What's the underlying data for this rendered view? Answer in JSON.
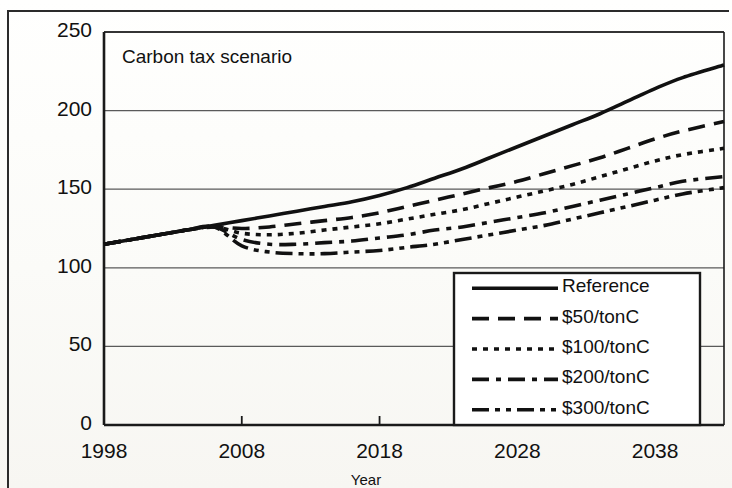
{
  "figure": {
    "title": "Carbon tax scenario",
    "x_axis_title": "Year"
  },
  "chart_data": {
    "type": "line",
    "title": "Carbon tax scenario",
    "xlabel": "Year",
    "ylabel": "",
    "xlim": [
      1998,
      2043
    ],
    "ylim": [
      0,
      250
    ],
    "xticks": [
      1998,
      2008,
      2018,
      2028,
      2038
    ],
    "yticks": [
      0,
      50,
      100,
      150,
      200,
      250
    ],
    "grid": "horizontal",
    "legend_position": "bottom-right",
    "x": [
      1998,
      2000,
      2002,
      2004,
      2006,
      2008,
      2010,
      2012,
      2014,
      2016,
      2018,
      2020,
      2022,
      2024,
      2026,
      2028,
      2030,
      2032,
      2034,
      2036,
      2038,
      2040,
      2043
    ],
    "series": [
      {
        "name": "Reference",
        "style": "solid",
        "values": [
          115,
          118,
          121,
          124,
          127,
          130,
          133,
          136,
          139,
          142,
          146,
          151,
          157,
          163,
          170,
          177,
          184,
          191,
          198,
          206,
          214,
          221,
          229
        ]
      },
      {
        "name": "$50/tonC",
        "style": "dashed",
        "values": [
          115,
          118,
          121,
          124,
          126,
          125,
          126,
          128,
          130,
          132,
          135,
          139,
          143,
          147,
          151,
          155,
          160,
          165,
          170,
          176,
          182,
          187,
          193
        ]
      },
      {
        "name": "$100/tonC",
        "style": "dotted",
        "values": [
          115,
          118,
          121,
          124,
          126,
          122,
          121,
          122,
          124,
          126,
          128,
          131,
          134,
          137,
          141,
          145,
          149,
          153,
          158,
          163,
          168,
          172,
          176
        ]
      },
      {
        "name": "$200/tonC",
        "style": "dash-dot",
        "values": [
          115,
          118,
          121,
          124,
          126,
          118,
          115,
          115,
          116,
          117,
          119,
          121,
          124,
          126,
          129,
          132,
          135,
          139,
          143,
          147,
          151,
          155,
          158
        ]
      },
      {
        "name": "$300/tonC",
        "style": "dash-dot-dot",
        "values": [
          115,
          118,
          121,
          124,
          126,
          114,
          110,
          109,
          109,
          110,
          111,
          113,
          115,
          118,
          121,
          124,
          127,
          131,
          135,
          139,
          143,
          147,
          151
        ]
      }
    ]
  },
  "legend": {
    "items": [
      {
        "label": "Reference",
        "style": "solid"
      },
      {
        "label": "$50/tonC",
        "style": "dashed"
      },
      {
        "label": "$100/tonC",
        "style": "dotted"
      },
      {
        "label": "$200/tonC",
        "style": "dash-dot"
      },
      {
        "label": "$300/tonC",
        "style": "dash-dot-dot"
      }
    ]
  },
  "colors": {
    "line": "#111111",
    "grid": "#5a5a5a",
    "axis": "#1a1a1a",
    "background": "#ffffff"
  }
}
